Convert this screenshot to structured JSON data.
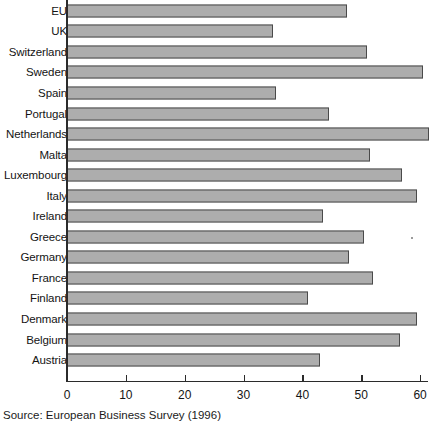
{
  "chart_data": {
    "type": "bar",
    "orientation": "horizontal",
    "title": "",
    "xlabel": "",
    "ylabel": "",
    "xlim": [
      0,
      61.5
    ],
    "xticks": [
      0,
      10,
      20,
      30,
      40,
      50,
      60
    ],
    "xtick_labels": [
      "0",
      "10",
      "20",
      "30",
      "40",
      "50",
      "60"
    ],
    "grid": false,
    "legend": null,
    "bar_color": "#adadad",
    "bar_edge_color": "#4a4a4a",
    "axis_color": "#2b2b2b",
    "categories": [
      "EU",
      "UK",
      "Switzerland",
      "Sweden",
      "Spain",
      "Portugal",
      "Netherlands",
      "Malta",
      "Luxembourg",
      "Italy",
      "Ireland",
      "Greece",
      "Germany",
      "France",
      "Finland",
      "Denmark",
      "Belgium",
      "Austria"
    ],
    "values": [
      47.5,
      35,
      51,
      60.5,
      35.5,
      44.5,
      61.5,
      51.5,
      57,
      59.5,
      43.5,
      50.5,
      48,
      52,
      41,
      59.5,
      56.5,
      43
    ]
  },
  "caption": {
    "source_text": "Source: European Business Survey (1996)"
  }
}
